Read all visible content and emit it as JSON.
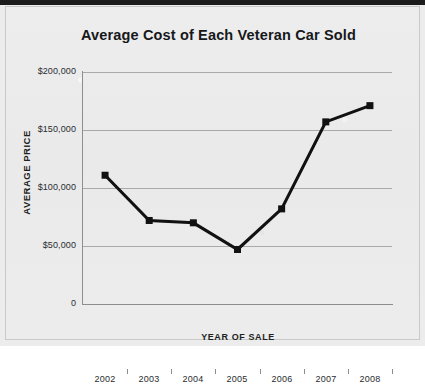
{
  "chart_data": {
    "type": "line",
    "title": "Average Cost of Each Veteran Car Sold",
    "xlabel": "YEAR OF SALE",
    "ylabel": "AVERAGE PRICE",
    "categories": [
      "2002",
      "2003",
      "2004",
      "2005",
      "2006",
      "2007",
      "2008"
    ],
    "values": [
      111000,
      72000,
      70000,
      47000,
      82000,
      157000,
      171000
    ],
    "series": [
      {
        "name": "Average Price",
        "values": [
          111000,
          72000,
          70000,
          47000,
          82000,
          157000,
          171000
        ]
      }
    ],
    "ylim": [
      0,
      200000
    ],
    "y_ticks": [
      0,
      50000,
      100000,
      150000,
      200000
    ],
    "y_tick_labels": [
      "0",
      "$50,000",
      "$100,000",
      "$150,000",
      "$200,000"
    ],
    "x_tick_labels": [
      "2002",
      "2003",
      "2004",
      "2005",
      "2006",
      "2007",
      "2008"
    ],
    "grid": true,
    "legend": false,
    "legend_position": "none",
    "marker": "square",
    "line_color": "#111111",
    "marker_color": "#111111",
    "grid_color": "#a9a9ab",
    "plot_background": "#ececed"
  },
  "axes": {
    "y_labels": [
      "$200,000",
      "$150,000",
      "$100,000",
      "$50,000",
      "0"
    ],
    "x_labels": [
      "2002",
      "2003",
      "2004",
      "2005",
      "2006",
      "2007",
      "2008"
    ]
  }
}
